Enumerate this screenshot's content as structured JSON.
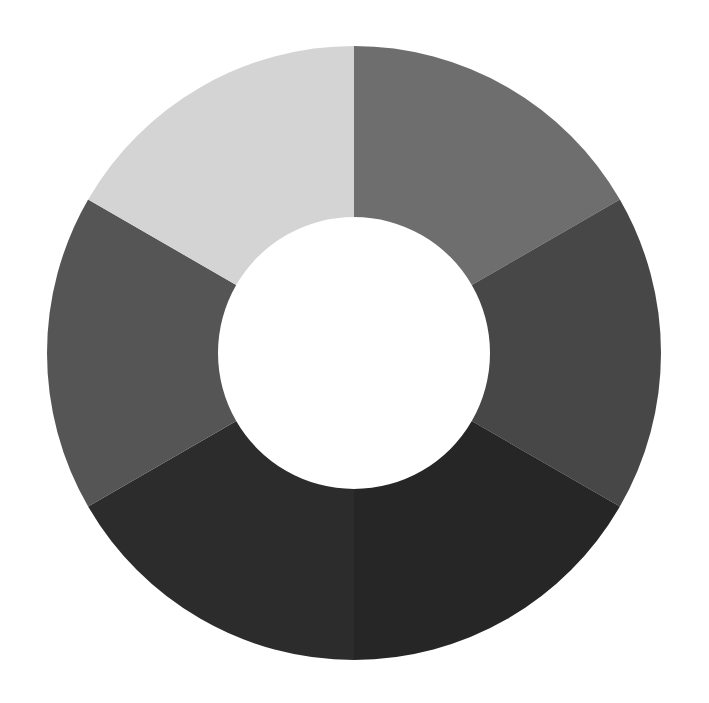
{
  "chart_data": {
    "type": "pie",
    "variant": "donut",
    "title": "",
    "legend": null,
    "categories": [
      "Segment 1",
      "Segment 2",
      "Segment 3",
      "Segment 4",
      "Segment 5",
      "Segment 6"
    ],
    "values": [
      1,
      1,
      1,
      1,
      1,
      1
    ],
    "percentages": [
      16.67,
      16.67,
      16.67,
      16.67,
      16.67,
      16.67
    ],
    "colors": [
      "#6e6e6e",
      "#474747",
      "#262626",
      "#2c2c2c",
      "#555555",
      "#d4d4d4"
    ],
    "start_angle_deg": 0,
    "direction": "clockwise",
    "geometry": {
      "cx": 354,
      "cy": 353,
      "outer_r": 307,
      "inner_r": 136
    },
    "labels_shown": false
  },
  "background": "#ffffff"
}
